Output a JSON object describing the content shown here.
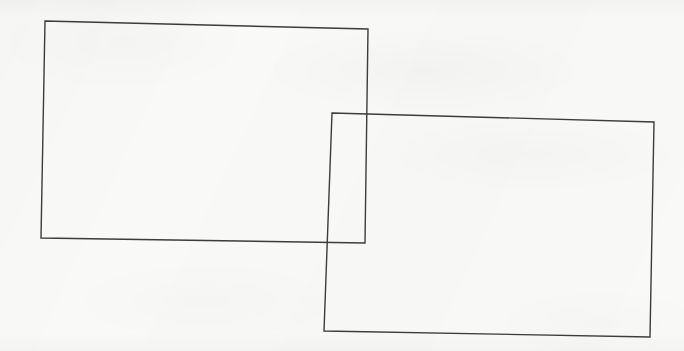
{
  "image": {
    "title": "Two overlapping rectangles",
    "width": 684,
    "height": 351,
    "background_color": "#f9f9f8",
    "stroke_color": "#3c3c3c",
    "stroke_width": 1.4,
    "fill": "none",
    "medium": "scanned line drawing"
  },
  "shapes": [
    {
      "id": "rectangle-1",
      "label": "Upper-left rectangle",
      "stroke_color": "#3c3c3c",
      "stroke_width": 1.4,
      "fill": "none",
      "points": [
        {
          "x": 45,
          "y": 21
        },
        {
          "x": 368,
          "y": 29
        },
        {
          "x": 365,
          "y": 243
        },
        {
          "x": 41,
          "y": 238
        }
      ],
      "approx_width": 323,
      "approx_height": 217,
      "z_order": 1
    },
    {
      "id": "rectangle-2",
      "label": "Lower-right rectangle",
      "stroke_color": "#3c3c3c",
      "stroke_width": 1.4,
      "fill": "none",
      "points": [
        {
          "x": 332,
          "y": 113
        },
        {
          "x": 654,
          "y": 122
        },
        {
          "x": 650,
          "y": 337
        },
        {
          "x": 324,
          "y": 331
        }
      ],
      "approx_width": 322,
      "approx_height": 218,
      "z_order": 2
    }
  ],
  "overlap": {
    "description": "Rectangles intersect in a region near the lower-right of rectangle 1 and upper-left of rectangle 2",
    "approx_region": {
      "x": 332,
      "y": 113,
      "width": 35,
      "height": 128
    }
  }
}
